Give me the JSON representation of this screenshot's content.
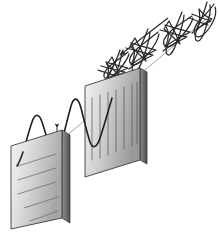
{
  "figure": {
    "title": "Polarization of light by two polarizing filters",
    "background_color": "#ffffff",
    "width": 218,
    "height": 242,
    "stroke_color": "#2b2b2b",
    "axis_color": "#8a8a8a"
  },
  "propagation": {
    "direction_label": "direction of travel",
    "arrow_from": [
      168,
      18
    ],
    "arrow_to": [
      120,
      55
    ],
    "axis_from": [
      212,
      14
    ],
    "axis_to": [
      16,
      178
    ]
  },
  "filters": [
    {
      "id": "second-polarizer",
      "name": "vertical-slit-polarizer",
      "slit_orientation": "vertical",
      "slit_count": 7,
      "face_points": "85,86 140,68 140,160 85,177",
      "edge_points": "140,68 147,72 147,164 140,160",
      "gradient": {
        "from": "#f4f4f4",
        "via": "#d2d2d2",
        "to": "#9a9a9a"
      },
      "edge_gradient": {
        "from": "#8f8f8f",
        "to": "#4a4a4a"
      },
      "border_color": "#3d3d3d"
    },
    {
      "id": "first-polarizer",
      "name": "horizontal-slit-polarizer",
      "slit_orientation": "horizontal",
      "slit_count": 5,
      "face_points": "11,146 62,130 62,218 11,229",
      "edge_points": "62,130 70,135 70,223 62,218",
      "gradient": {
        "from": "#f6f6f6",
        "via": "#d8d8d8",
        "to": "#a6a6a6"
      },
      "edge_gradient": {
        "from": "#949494",
        "to": "#4f4f4f"
      },
      "border_color": "#3d3d3d"
    }
  ],
  "waves": {
    "unpolarized": {
      "label": "unpolarized light",
      "description": "multiple oscillation planes shown as overlapping bow-tie lobes",
      "plane_angles_deg": [
        0,
        30,
        60,
        90,
        120,
        150
      ],
      "cycles": 3.5,
      "amplitude": 21
    },
    "polarized": {
      "label": "plane-polarized light",
      "description": "single vertical oscillation plane sine wave",
      "cycles": 2.5,
      "amplitude": 27
    }
  },
  "markers": {
    "polarized_plane_arrow": {
      "name": "vertical-double-arrow",
      "from": [
        57,
        128
      ],
      "to": [
        57,
        162
      ]
    },
    "filter_entry_arrow": {
      "name": "entry-arrow",
      "from": [
        146,
        78
      ],
      "to": [
        126,
        96
      ]
    }
  }
}
